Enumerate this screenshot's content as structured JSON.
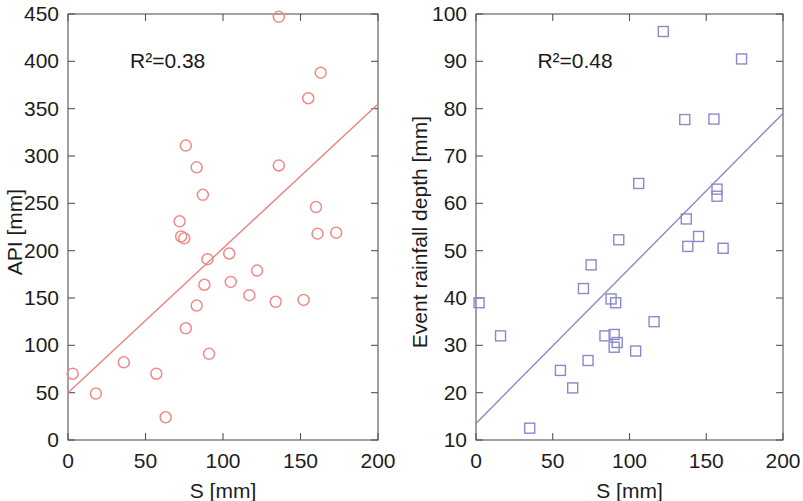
{
  "figure": {
    "panel_count": 2,
    "background_color": "#ffffff"
  },
  "chart_data": [
    {
      "type": "scatter",
      "panel": "left",
      "title": "",
      "xlabel": "S [mm]",
      "ylabel": "API [mm]",
      "xlim": [
        0,
        200
      ],
      "ylim": [
        0,
        450
      ],
      "xticks": [
        0,
        50,
        100,
        150,
        200
      ],
      "yticks": [
        0,
        50,
        100,
        150,
        200,
        250,
        300,
        350,
        400,
        450
      ],
      "xticklabels": [
        "0",
        "50",
        "100",
        "150",
        "200"
      ],
      "yticklabels": [
        "0",
        "50",
        "100",
        "150",
        "200",
        "250",
        "300",
        "350",
        "400",
        "450"
      ],
      "grid": false,
      "legend": "none",
      "annotation": "R²=0.38",
      "annotation_x": 40,
      "annotation_y": 400,
      "marker": "open-circle",
      "marker_color": "#ef8a8a",
      "marker_size": 11,
      "points": [
        {
          "x": 3,
          "y": 70
        },
        {
          "x": 18,
          "y": 49
        },
        {
          "x": 36,
          "y": 82
        },
        {
          "x": 57,
          "y": 70
        },
        {
          "x": 63,
          "y": 24
        },
        {
          "x": 72,
          "y": 231
        },
        {
          "x": 73,
          "y": 215
        },
        {
          "x": 75,
          "y": 213
        },
        {
          "x": 76,
          "y": 311
        },
        {
          "x": 76,
          "y": 118
        },
        {
          "x": 83,
          "y": 288
        },
        {
          "x": 83,
          "y": 142
        },
        {
          "x": 87,
          "y": 259
        },
        {
          "x": 88,
          "y": 164
        },
        {
          "x": 90,
          "y": 191
        },
        {
          "x": 91,
          "y": 91
        },
        {
          "x": 104,
          "y": 197
        },
        {
          "x": 105,
          "y": 167
        },
        {
          "x": 117,
          "y": 153
        },
        {
          "x": 122,
          "y": 179
        },
        {
          "x": 134,
          "y": 146
        },
        {
          "x": 136,
          "y": 447
        },
        {
          "x": 136,
          "y": 290
        },
        {
          "x": 152,
          "y": 148
        },
        {
          "x": 155,
          "y": 361
        },
        {
          "x": 160,
          "y": 246
        },
        {
          "x": 161,
          "y": 218
        },
        {
          "x": 163,
          "y": 388
        },
        {
          "x": 173,
          "y": 219
        }
      ],
      "trendline": {
        "color": "#f08080",
        "x_start": 0,
        "y_start": 50,
        "x_end": 200,
        "y_end": 355,
        "r_squared": 0.38
      }
    },
    {
      "type": "scatter",
      "panel": "right",
      "title": "",
      "xlabel": "S [mm]",
      "ylabel": "Event rainfall depth [mm]",
      "xlim": [
        0,
        200
      ],
      "ylim": [
        10,
        100
      ],
      "xticks": [
        0,
        50,
        100,
        150,
        200
      ],
      "yticks": [
        10,
        20,
        30,
        40,
        50,
        60,
        70,
        80,
        90,
        100
      ],
      "xticklabels": [
        "0",
        "50",
        "100",
        "150",
        "200"
      ],
      "yticklabels": [
        "10",
        "20",
        "30",
        "40",
        "50",
        "60",
        "70",
        "80",
        "90",
        "100"
      ],
      "grid": false,
      "legend": "none",
      "annotation": "R²=0.48",
      "annotation_x": 40,
      "annotation_y": 90,
      "marker": "open-square",
      "marker_color": "#8a8ac8",
      "marker_size": 10,
      "points": [
        {
          "x": 2,
          "y": 39
        },
        {
          "x": 16,
          "y": 32
        },
        {
          "x": 35,
          "y": 12.5
        },
        {
          "x": 55,
          "y": 24.7
        },
        {
          "x": 63,
          "y": 21
        },
        {
          "x": 70,
          "y": 42
        },
        {
          "x": 73,
          "y": 26.8
        },
        {
          "x": 75,
          "y": 47
        },
        {
          "x": 84,
          "y": 32
        },
        {
          "x": 88,
          "y": 39.8
        },
        {
          "x": 90,
          "y": 32.3
        },
        {
          "x": 90,
          "y": 29.6
        },
        {
          "x": 91,
          "y": 39
        },
        {
          "x": 92,
          "y": 30.6
        },
        {
          "x": 93,
          "y": 52.3
        },
        {
          "x": 104,
          "y": 28.8
        },
        {
          "x": 106,
          "y": 64.2
        },
        {
          "x": 116,
          "y": 35
        },
        {
          "x": 122,
          "y": 96.3
        },
        {
          "x": 136,
          "y": 77.7
        },
        {
          "x": 137,
          "y": 56.7
        },
        {
          "x": 138,
          "y": 50.9
        },
        {
          "x": 145,
          "y": 53
        },
        {
          "x": 155,
          "y": 77.8
        },
        {
          "x": 157,
          "y": 63
        },
        {
          "x": 157,
          "y": 61.5
        },
        {
          "x": 161,
          "y": 50.5
        },
        {
          "x": 173,
          "y": 90.5
        }
      ],
      "trendline": {
        "color": "#8a8ac8",
        "x_start": 0,
        "y_start": 13.5,
        "x_end": 200,
        "y_end": 79,
        "r_squared": 0.48
      }
    }
  ]
}
